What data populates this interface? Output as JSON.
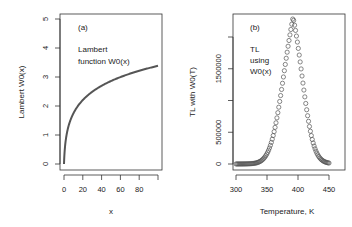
{
  "chart_data": [
    {
      "type": "line",
      "panel_label": "(a)",
      "annotation": [
        "Lambert",
        "function W0(x)"
      ],
      "xlabel": "x",
      "ylabel": "Lambert W0(x)",
      "xlim": [
        0,
        100
      ],
      "ylim": [
        0,
        5
      ],
      "xticks": [
        0,
        20,
        40,
        60,
        80,
        100
      ],
      "xtick_labels": [
        "0",
        "20",
        "40",
        "60",
        "80",
        ""
      ],
      "yticks": [
        0,
        1,
        2,
        3,
        4,
        5
      ],
      "ytick_labels": [
        "0",
        "1",
        "2",
        "3",
        "4",
        "5"
      ],
      "grid": false,
      "series": [
        {
          "name": "W0(x)",
          "x": [
            0,
            1,
            2,
            5,
            10,
            15,
            20,
            30,
            40,
            50,
            60,
            70,
            80,
            90,
            100
          ],
          "y": [
            0,
            0.567,
            0.853,
            1.327,
            1.746,
            1.998,
            2.205,
            2.502,
            2.732,
            2.861,
            2.999,
            3.118,
            3.222,
            3.315,
            3.386
          ]
        }
      ],
      "color": "#555555"
    },
    {
      "type": "scatter",
      "panel_label": "(b)",
      "annotation": [
        "TL",
        "using",
        "W0(x)"
      ],
      "xlabel": "Temperature, K",
      "ylabel": "TL with W0(T)",
      "xlim": [
        300,
        450
      ],
      "ylim": [
        0,
        2300000
      ],
      "xticks": [
        300,
        350,
        400,
        450
      ],
      "xtick_labels": [
        "300",
        "350",
        "400",
        "450"
      ],
      "yticks": [
        0,
        500000,
        1000000,
        1500000,
        2000000
      ],
      "ytick_labels": [
        "0",
        "500000",
        "",
        "1500000",
        ""
      ],
      "grid": false,
      "marker": "open-circle",
      "series": [
        {
          "name": "TL",
          "x": [
            300,
            310,
            320,
            330,
            340,
            350,
            360,
            370,
            380,
            385,
            390,
            392,
            395,
            400,
            405,
            410,
            420,
            430,
            440,
            450
          ],
          "y": [
            10000,
            20000,
            40000,
            90000,
            180000,
            380000,
            750000,
            1300000,
            1950000,
            2200000,
            2300000,
            2310000,
            2250000,
            2000000,
            1650000,
            1250000,
            640000,
            300000,
            140000,
            60000
          ]
        }
      ],
      "color": "#555555"
    }
  ]
}
